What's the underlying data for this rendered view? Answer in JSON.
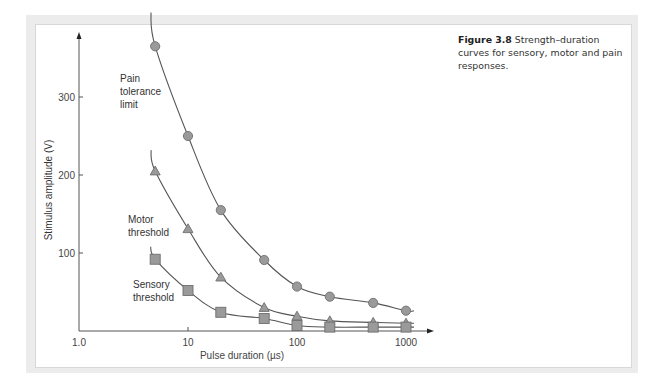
{
  "figure": {
    "number_label": "Figure 3.8",
    "caption_text": "Strength–duration curves for sensory, motor and pain responses."
  },
  "chart_data": {
    "type": "scatter",
    "title": "Strength–duration curves for sensory, motor and pain responses",
    "xlabel": "Pulse duration (µs)",
    "ylabel": "Stimulus amplitude (V)",
    "xscale": "log",
    "xlim": [
      1,
      1000
    ],
    "ylim": [
      0,
      370
    ],
    "x_ticks": [
      "1.0",
      "10",
      "100",
      "1000"
    ],
    "y_ticks": [
      "100",
      "200",
      "300"
    ],
    "grid": false,
    "legend": "inline annotations",
    "x": [
      5,
      10,
      20,
      50,
      100,
      200,
      500,
      1000
    ],
    "series": [
      {
        "name": "Pain tolerance limit",
        "marker": "circle",
        "values": [
          365,
          250,
          155,
          91,
          57,
          44,
          36,
          26
        ]
      },
      {
        "name": "Motor threshold",
        "marker": "triangle",
        "values": [
          205,
          131,
          69,
          30,
          19,
          13,
          11,
          10
        ]
      },
      {
        "name": "Sensory threshold",
        "marker": "square",
        "values": [
          92,
          52,
          24,
          16,
          7,
          5,
          5,
          5
        ]
      }
    ],
    "annotations": [
      {
        "lines": [
          "Pain",
          "tolerance",
          "limit"
        ],
        "series": "Pain tolerance limit"
      },
      {
        "lines": [
          "Motor",
          "threshold"
        ],
        "series": "Motor threshold"
      },
      {
        "lines": [
          "Sensory",
          "threshold"
        ],
        "series": "Sensory threshold"
      }
    ],
    "colors": {
      "curve": "#555555",
      "marker_fill": "#9a9a9a",
      "marker_stroke": "#6e6e6e",
      "axis": "#555555"
    }
  }
}
